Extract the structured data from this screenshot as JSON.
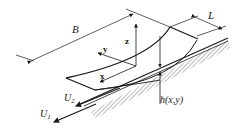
{
  "diagram": {
    "type": "bearing-film-geometry",
    "labels": {
      "width": "B",
      "length": "L",
      "axis_x": "x",
      "axis_y": "y",
      "axis_z": "z",
      "film_thickness": "h(x,y)",
      "velocity_1": "U",
      "velocity_1_sub": "1",
      "velocity_2": "U",
      "velocity_2_sub": "2"
    },
    "colors": {
      "line": "#1a1a1a",
      "hatch": "#555555",
      "background": "#ffffff"
    }
  }
}
